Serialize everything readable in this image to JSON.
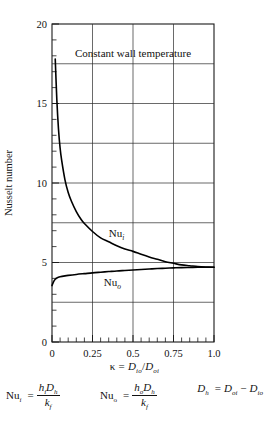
{
  "chart_data": {
    "type": "line",
    "title": "Constant wall temperature",
    "xlabel": "κ = D_io/D_oi",
    "ylabel": "Nusselt number",
    "xlim": [
      0,
      1.0
    ],
    "ylim": [
      0,
      20
    ],
    "grid": true,
    "legend": "inline-curve-labels",
    "x_ticks": [
      "0",
      "0.25",
      "0.5",
      "0.75",
      "1.0"
    ],
    "x_tick_values": [
      0,
      0.25,
      0.5,
      0.75,
      1.0
    ],
    "y_ticks": [
      "0",
      "5",
      "10",
      "15",
      "20"
    ],
    "y_tick_values": [
      0,
      5,
      10,
      15,
      20
    ],
    "x_minor_step": 0.05,
    "y_minor_step": 1,
    "series": [
      {
        "name": "Nu_i",
        "label": "Nu",
        "label_sub": "i",
        "label_x": 0.35,
        "label_y": 6.6,
        "x": [
          0.02,
          0.03,
          0.04,
          0.05,
          0.06,
          0.08,
          0.1,
          0.12,
          0.15,
          0.18,
          0.2,
          0.25,
          0.3,
          0.35,
          0.4,
          0.45,
          0.5,
          0.55,
          0.6,
          0.65,
          0.7,
          0.75,
          0.8,
          0.85,
          0.9,
          0.95,
          1.0
        ],
        "y": [
          17.8,
          15.2,
          13.4,
          12.2,
          11.4,
          10.2,
          9.4,
          8.85,
          8.2,
          7.7,
          7.45,
          6.95,
          6.55,
          6.3,
          6.05,
          5.85,
          5.7,
          5.52,
          5.35,
          5.2,
          5.05,
          4.95,
          4.85,
          4.8,
          4.75,
          4.72,
          4.7
        ]
      },
      {
        "name": "Nu_o",
        "label": "Nu",
        "label_sub": "o",
        "label_x": 0.32,
        "label_y": 3.5,
        "x": [
          0.0,
          0.01,
          0.02,
          0.03,
          0.05,
          0.08,
          0.1,
          0.15,
          0.2,
          0.25,
          0.3,
          0.35,
          0.4,
          0.45,
          0.5,
          0.55,
          0.6,
          0.65,
          0.7,
          0.75,
          0.8,
          0.85,
          0.9,
          0.95,
          1.0
        ],
        "y": [
          3.55,
          3.8,
          3.95,
          4.03,
          4.1,
          4.16,
          4.19,
          4.25,
          4.3,
          4.35,
          4.39,
          4.43,
          4.47,
          4.5,
          4.53,
          4.56,
          4.59,
          4.62,
          4.64,
          4.66,
          4.68,
          4.69,
          4.7,
          4.7,
          4.7
        ]
      }
    ],
    "converge_note": "Nu_i and Nu_o converge near κ = 0.8 at Nu ≈ 4.7"
  },
  "axis": {
    "y_title": "Nusselt number",
    "x_title_kappa": "κ",
    "x_title_eq": "=",
    "x_title_num": "D",
    "x_title_num_sub": "io",
    "x_title_slash": "/",
    "x_title_den": "D",
    "x_title_den_sub": "oi"
  },
  "formulas": [
    {
      "id": "nu-i",
      "lhs": "Nu",
      "lhs_sub": "i",
      "eq": "=",
      "num_a": "h",
      "num_a_sub": "i",
      "num_b": "D",
      "num_b_sub": "h",
      "den": "k",
      "den_sub": "f"
    },
    {
      "id": "nu-o",
      "lhs": "Nu",
      "lhs_sub": "o",
      "eq": "=",
      "num_a": "h",
      "num_a_sub": "o",
      "num_b": "D",
      "num_b_sub": "h",
      "den": "k",
      "den_sub": "f"
    },
    {
      "id": "d-h",
      "lhs": "D",
      "lhs_sub": "h",
      "eq": "=",
      "term_a": "D",
      "term_a_sub": "oi",
      "minus": "−",
      "term_b": "D",
      "term_b_sub": "io"
    }
  ],
  "colors": {
    "curve": "#000000",
    "grid": "#2a2a2a",
    "axis": "#1a1a1a",
    "background": "#ffffff"
  }
}
